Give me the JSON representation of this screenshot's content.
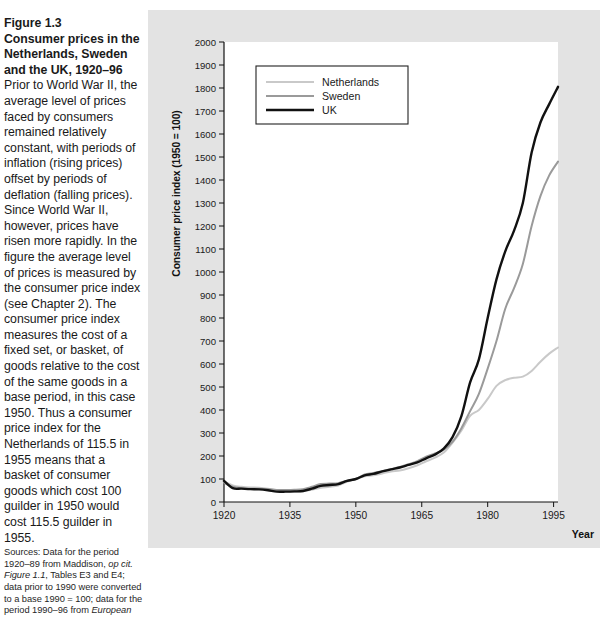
{
  "caption": {
    "figure_number": "Figure 1.3",
    "title": "Consumer prices in the Netherlands, Sweden and the UK, 1920–96",
    "body": "Prior to World War II, the average level of prices faced by consumers remained relatively constant, with periods of inflation (rising prices) offset by periods of deflation (falling prices). Since World War II, however, prices have risen more rapidly. In the figure the average level of prices is measured by the consumer price index (see Chapter 2). The consumer price index measures the cost of a fixed set, or basket, of goods relative to the cost of the same goods in a base period, in this case 1950. Thus a consumer price index for the Netherlands of 115.5 in 1955 means that a basket of consumer goods which cost 100 guilder in 1950 would cost 115.5 guilder in 1955.",
    "source_prefix": "Sources:",
    "source_line1": " Data for the period 1920–89 from Maddison, ",
    "source_italic1": "op cit.",
    "source_italic2": "Figure 1.1",
    "source_line2": ", Tables E3 and E4; data prior to 1990 were converted to a base 1990 = 100; data for the period 1990–96 from ",
    "source_italic3": "European"
  },
  "chart_data": {
    "type": "line",
    "title": "",
    "xlabel": "Year",
    "ylabel": "Consumer price index (1950 = 100)",
    "xlim": [
      1920,
      1996
    ],
    "ylim": [
      0,
      2000
    ],
    "xticks": [
      1920,
      1935,
      1950,
      1965,
      1980,
      1995
    ],
    "yticks": [
      0,
      100,
      200,
      300,
      400,
      500,
      600,
      700,
      800,
      900,
      1000,
      1100,
      1200,
      1300,
      1400,
      1500,
      1600,
      1700,
      1800,
      1900,
      2000
    ],
    "grid": false,
    "legend_position": "upper-left-inside",
    "colors": {
      "netherlands": "#c9c9c9",
      "sweden": "#9a9a9a",
      "uk": "#111111"
    },
    "x": [
      1920,
      1922,
      1924,
      1926,
      1928,
      1930,
      1932,
      1934,
      1936,
      1938,
      1940,
      1942,
      1944,
      1946,
      1948,
      1950,
      1952,
      1954,
      1956,
      1958,
      1960,
      1962,
      1964,
      1966,
      1968,
      1970,
      1972,
      1974,
      1976,
      1978,
      1980,
      1982,
      1984,
      1986,
      1988,
      1990,
      1992,
      1994,
      1996
    ],
    "series": [
      {
        "name": "Netherlands",
        "values": [
          88,
          72,
          66,
          63,
          62,
          58,
          50,
          47,
          45,
          47,
          53,
          62,
          66,
          72,
          88,
          100,
          112,
          116,
          124,
          133,
          137,
          147,
          160,
          177,
          193,
          215,
          258,
          310,
          375,
          400,
          448,
          505,
          530,
          540,
          545,
          570,
          610,
          645,
          672
        ]
      },
      {
        "name": "Sweden",
        "values": [
          84,
          66,
          60,
          58,
          58,
          56,
          52,
          52,
          53,
          56,
          66,
          78,
          80,
          82,
          92,
          100,
          120,
          126,
          134,
          143,
          152,
          164,
          178,
          197,
          211,
          228,
          262,
          320,
          395,
          470,
          580,
          700,
          840,
          930,
          1035,
          1200,
          1330,
          1420,
          1480
        ]
      },
      {
        "name": "UK",
        "values": [
          92,
          60,
          58,
          56,
          55,
          51,
          45,
          45,
          46,
          48,
          58,
          70,
          74,
          78,
          92,
          100,
          116,
          122,
          133,
          142,
          150,
          161,
          172,
          190,
          206,
          232,
          282,
          372,
          520,
          620,
          800,
          968,
          1090,
          1180,
          1300,
          1520,
          1650,
          1730,
          1805
        ]
      }
    ]
  },
  "legend": {
    "items": [
      {
        "label": "Netherlands"
      },
      {
        "label": "Sweden"
      },
      {
        "label": "UK"
      }
    ]
  }
}
